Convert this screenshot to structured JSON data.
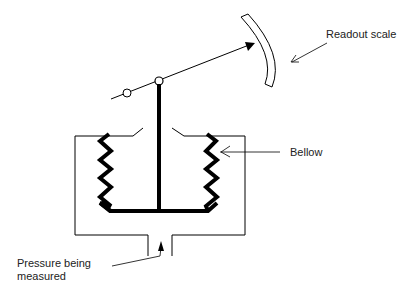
{
  "diagram": {
    "labels": {
      "readout_scale": "Readout scale",
      "bellow": "Bellow",
      "pressure_line1": "Pressure being",
      "pressure_line2": "measured"
    },
    "colors": {
      "stroke": "#000000",
      "text": "#222222",
      "background": "#ffffff"
    }
  }
}
